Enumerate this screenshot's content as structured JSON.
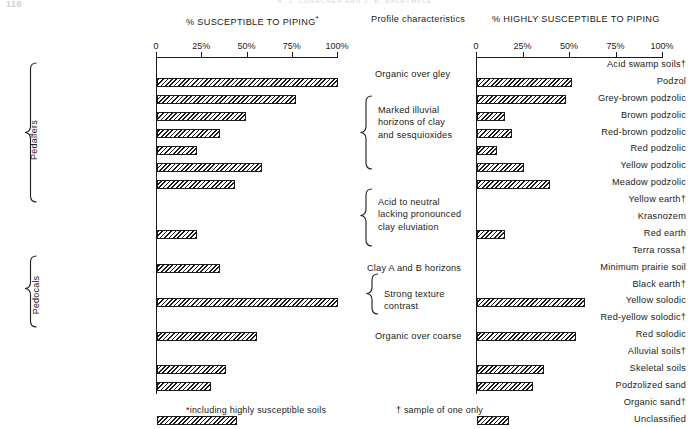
{
  "page": {
    "folio": "116",
    "running_head": "A. J. CONACHER AND J. B. DALRYMPLE"
  },
  "headings": {
    "left_chart": "% SUSCEPTIBLE TO PIPING",
    "left_chart_marker": "*",
    "middle_column": "Profile characteristics",
    "right_chart": "% HIGHLY SUSCEPTIBLE TO PIPING"
  },
  "axis": {
    "tick_labels_left": [
      "0",
      "25%",
      "50%",
      "75%",
      "100%"
    ],
    "tick_labels_right": [
      "0",
      "25%",
      "50%",
      "75%",
      "100%"
    ],
    "ticks": [
      0,
      25,
      50,
      75,
      100
    ],
    "min": 0,
    "max": 100
  },
  "groups": [
    {
      "label": "Pedalfers"
    },
    {
      "label": "Pedocals"
    }
  ],
  "profile_characteristics": [
    {
      "text": "Organic over gley",
      "braced": false
    },
    {
      "text": "Marked illuvial\nhorizons of clay\nand sesquioxides",
      "braced": true
    },
    {
      "text": "Acid to neutral\nlacking pronounced\nclay eluviation",
      "braced": true
    },
    {
      "text": "Clay A and B horizons",
      "braced": false
    },
    {
      "text": "Strong texture\ncontrast",
      "braced": true
    },
    {
      "text": "Organic over coarse",
      "braced": false
    }
  ],
  "footnotes": {
    "asterisk": "*including highly susceptible soils",
    "dagger": "† sample of one only"
  },
  "chart_data": {
    "type": "bar",
    "orientation": "horizontal",
    "xlabel": "",
    "ylabel": "",
    "xlim": [
      0,
      100
    ],
    "grid": false,
    "legend": "none",
    "categories": [
      "Acid swamp soils†",
      "Podzol",
      "Grey-brown podzolic",
      "Brown podzolic",
      "Red-brown podzolic",
      "Red podzolic",
      "Yellow podzolic",
      "Meadow podzolic",
      "Yellow earth†",
      "Krasnozem",
      "Red earth",
      "Terra rossa†",
      "Minimum prairie soil",
      "Black earth†",
      "Yellow solodic",
      "Red-yellow solodic†",
      "Red solodic",
      "Alluvial soils†",
      "Skeletal soils",
      "Podzolized sand",
      "Organic sand†",
      "Unclassified"
    ],
    "series": [
      {
        "name": "% SUSCEPTIBLE TO PIPING",
        "values": [
          0,
          100,
          77,
          49,
          35,
          22,
          58,
          43,
          0,
          0,
          22,
          0,
          35,
          0,
          100,
          0,
          55,
          0,
          38,
          30,
          0,
          44
        ]
      },
      {
        "name": "% HIGHLY SUSCEPTIBLE TO PIPING",
        "values": [
          0,
          51,
          48,
          15,
          19,
          11,
          25,
          39,
          0,
          0,
          15,
          0,
          0,
          0,
          58,
          0,
          53,
          0,
          36,
          30,
          0,
          17
        ]
      }
    ]
  }
}
